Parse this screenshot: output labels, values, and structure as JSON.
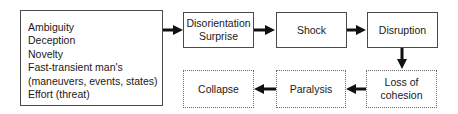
{
  "diagram": {
    "causes": {
      "items": [
        "Ambiguity",
        "Deception",
        "Novelty",
        "Fast-transient man's",
        "(maneuvers, events, states)",
        "Effort (threat)"
      ]
    },
    "nodes": {
      "disorientation": {
        "line1": "Disorientation",
        "line2": "Surprise",
        "style": "solid"
      },
      "shock": {
        "label": "Shock",
        "style": "solid"
      },
      "disruption": {
        "label": "Disruption",
        "style": "solid"
      },
      "loss_of_cohesion": {
        "line1": "Loss of",
        "line2": "cohesion",
        "style": "dotted"
      },
      "paralysis": {
        "label": "Paralysis",
        "style": "dotted"
      },
      "collapse": {
        "label": "Collapse",
        "style": "dotted"
      }
    },
    "edges": [
      {
        "from": "causes",
        "to": "disorientation",
        "direction": "right"
      },
      {
        "from": "disorientation",
        "to": "shock",
        "direction": "right"
      },
      {
        "from": "shock",
        "to": "disruption",
        "direction": "right"
      },
      {
        "from": "disruption",
        "to": "loss_of_cohesion",
        "direction": "down"
      },
      {
        "from": "loss_of_cohesion",
        "to": "paralysis",
        "direction": "left"
      },
      {
        "from": "paralysis",
        "to": "collapse",
        "direction": "left"
      }
    ],
    "colors": {
      "border": "#4a4a4a",
      "arrow": "#111111",
      "text": "#1a1a1a"
    }
  }
}
